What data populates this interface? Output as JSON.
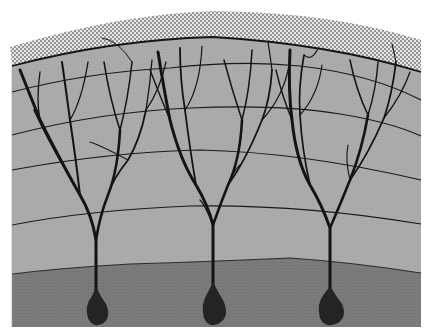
{
  "figure": {
    "neuron_count": 3,
    "layers": [
      {
        "name": "surface-stipple-layer",
        "color": "#bdbdbd"
      },
      {
        "name": "dendritic-layer",
        "color": "#a9a9a9"
      },
      {
        "name": "cell-body-layer",
        "color": "#7a7a7a"
      }
    ],
    "colors": {
      "background": "#ffffff",
      "stipple_dot": "#6e6e6e",
      "upper_layer": "#adadad",
      "lower_layer": "#7b7b7b",
      "ink": "#141414",
      "soma": "#2a2a2a"
    }
  }
}
